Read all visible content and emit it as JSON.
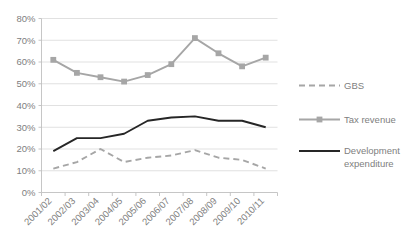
{
  "chart_data": {
    "type": "line",
    "title": "",
    "xlabel": "",
    "ylabel": "",
    "ylim": [
      0,
      80
    ],
    "ytick_step": 10,
    "grid": true,
    "legend_position": "right",
    "categories": [
      "2001/02",
      "2002/03",
      "2003/04",
      "2004/05",
      "2005/06",
      "2006/07",
      "2007/08",
      "2008/09",
      "2009/10",
      "2010/11"
    ],
    "ytick_labels": [
      "0%",
      "10%",
      "20%",
      "30%",
      "40%",
      "50%",
      "60%",
      "70%",
      "80%"
    ],
    "ytick_values": [
      0,
      10,
      20,
      30,
      40,
      50,
      60,
      70,
      80
    ],
    "series": [
      {
        "name": "GBS",
        "color": "#a6a6a6",
        "style": "dashed",
        "marker": "none",
        "values": [
          11,
          14,
          20,
          14,
          16,
          17,
          19.5,
          16,
          15,
          11
        ]
      },
      {
        "name": "Tax revenue",
        "color": "#a6a6a6",
        "style": "solid",
        "marker": "square",
        "values": [
          61,
          55,
          53,
          51,
          54,
          59,
          71,
          64,
          58,
          62
        ]
      },
      {
        "name": "Development expenditure",
        "color": "#262626",
        "style": "solid",
        "marker": "none",
        "values": [
          19,
          25,
          25,
          27,
          33,
          34.5,
          35,
          33,
          33,
          30
        ]
      }
    ]
  },
  "legend": {
    "items": [
      {
        "label": "GBS"
      },
      {
        "label": "Tax revenue"
      },
      {
        "label": "Development expenditure"
      }
    ]
  }
}
